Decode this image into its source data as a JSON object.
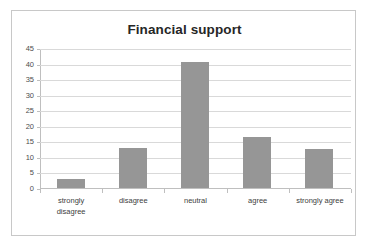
{
  "chart_data": {
    "type": "bar",
    "title": "Financial support",
    "xlabel": "",
    "ylabel": "",
    "categories": [
      "strongly disagree",
      "disagree",
      "neutral",
      "agree",
      "strongly agree"
    ],
    "category_labels_wrapped": [
      "strongly\ndisagree",
      "disagree",
      "neutral",
      "agree",
      "strongly agree"
    ],
    "values": [
      3,
      13,
      40.7,
      16.6,
      12.7
    ],
    "ylim": [
      0,
      45
    ],
    "ytick_values": [
      0,
      5,
      10,
      15,
      20,
      25,
      30,
      35,
      40,
      45
    ],
    "ytick_labels": [
      "0",
      "5",
      "10",
      "15",
      "20",
      "25",
      "30",
      "35",
      "40",
      "45"
    ],
    "grid": true,
    "grid_axis": "y",
    "legend": false,
    "legend_position": "none",
    "bar_color": "#969696",
    "gridline_color": "#d9d9d9",
    "axis_color": "#bfbfbf",
    "title_color": "#262626",
    "tick_label_color": "#4d4d4d",
    "plot_background": "#ffffff",
    "frame_border_color": "#c8c8c8"
  }
}
